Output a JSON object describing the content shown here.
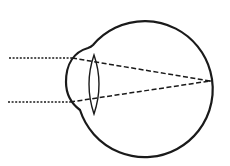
{
  "diagram": {
    "title": "",
    "colors": {
      "background": "#ffffff",
      "stroke": "#1a1a1a"
    },
    "parts": {
      "eyeball": {
        "cx": 143,
        "cy": 82,
        "r": 68
      },
      "cornea": {
        "leftmost_x": 66,
        "top_join": [
          93,
          45
        ],
        "bottom_join": [
          80,
          110
        ]
      },
      "lens": {
        "cx": 94,
        "top_y": 55,
        "bottom_y": 114,
        "half_width": 9
      },
      "focal_point": [
        210,
        81
      ]
    },
    "rays": [
      {
        "name": "upper-ray",
        "start": [
          9,
          58
        ],
        "enter": [
          72,
          58
        ],
        "end": [
          210,
          81
        ]
      },
      {
        "name": "lower-ray",
        "start": [
          8,
          102
        ],
        "enter": [
          70,
          102
        ],
        "end": [
          210,
          81
        ]
      }
    ]
  }
}
